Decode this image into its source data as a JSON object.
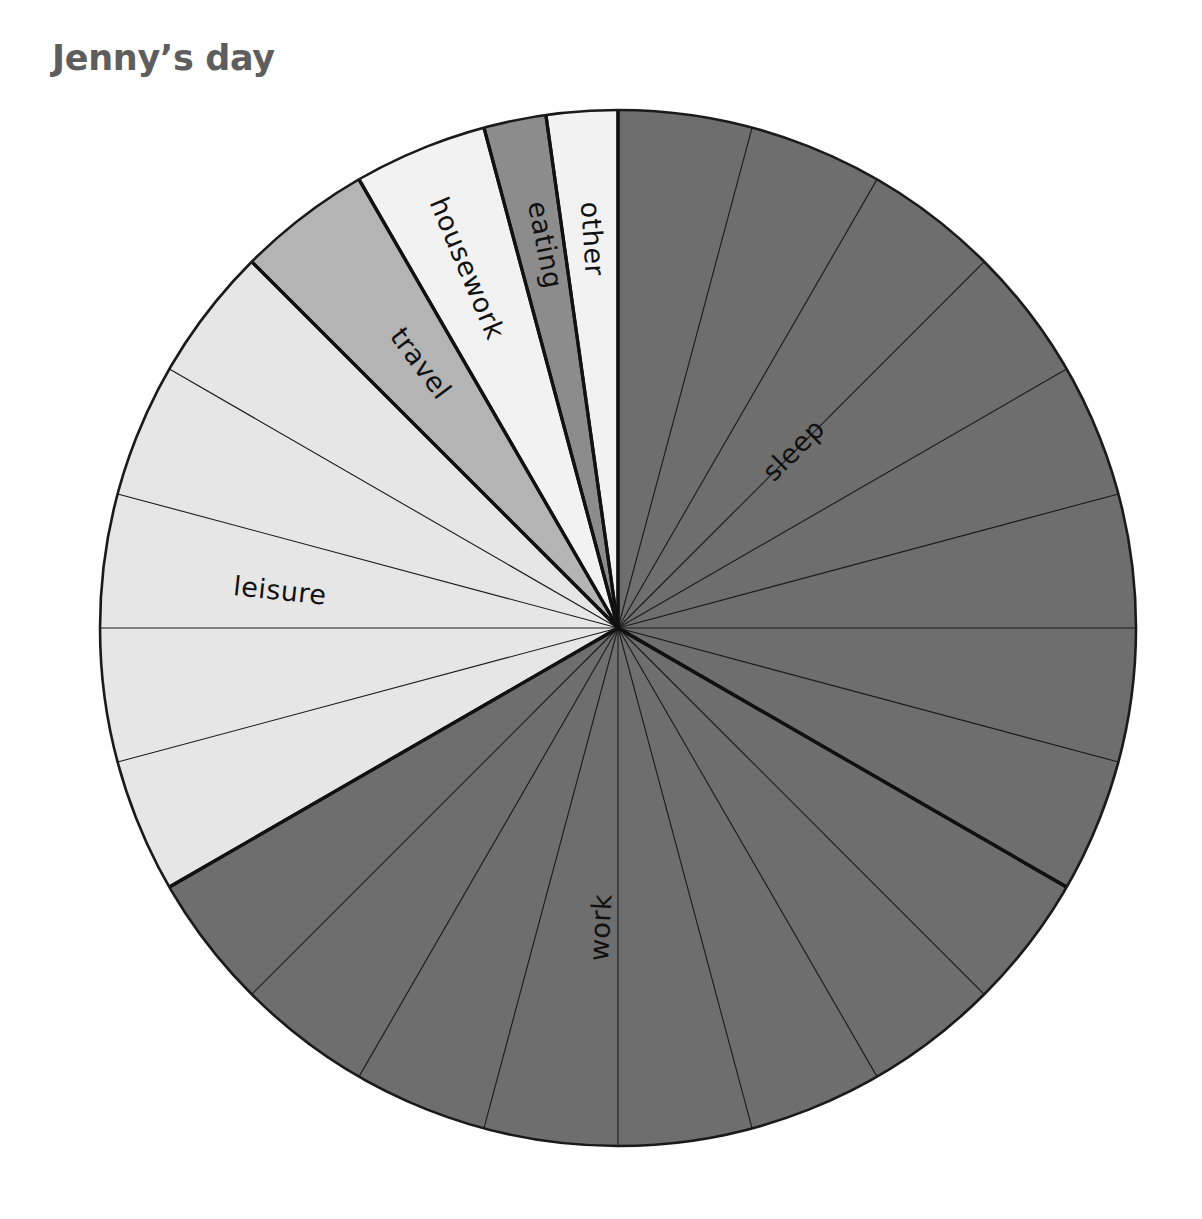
{
  "title": "Jenny’s day",
  "chart_data": {
    "type": "pie",
    "title": "Jenny’s day",
    "subtitle": "",
    "xlabel": "",
    "ylabel": "",
    "units": "hours",
    "total": 24,
    "start_angle_deg": 0,
    "direction": "clockwise",
    "grid": true,
    "gridline_interval_hours": 1,
    "legend": "none",
    "labels_inside_slices": true,
    "categories": [
      "sleep",
      "work",
      "leisure",
      "travel",
      "housework",
      "eating",
      "other"
    ],
    "values": [
      8,
      8,
      5,
      1,
      1,
      1,
      1
    ],
    "percentages": [
      33.3,
      33.3,
      20.8,
      4.2,
      4.2,
      4.2,
      4.2
    ],
    "colors": [
      "#6e6e6e",
      "#6e6e6e",
      "#e6e6e6",
      "#b4b4b4",
      "#f2f2f2",
      "#8c8c8c",
      "#f2f2f2"
    ],
    "slices": [
      {
        "label": "sleep",
        "value": 8,
        "start_deg": 0,
        "end_deg": 120,
        "color": "#6e6e6e",
        "label_angle_deg": 45,
        "label_radius": 250
      },
      {
        "label": "work",
        "value": 8,
        "start_deg": 120,
        "end_deg": 240,
        "color": "#6e6e6e",
        "label_angle_deg": 183,
        "label_radius": 300
      },
      {
        "label": "leisure",
        "value": 5,
        "start_deg": 240,
        "end_deg": 315,
        "color": "#e6e6e6",
        "label_angle_deg": 276,
        "label_radius": 340
      },
      {
        "label": "travel",
        "value": 1,
        "start_deg": 315,
        "end_deg": 330,
        "color": "#b4b4b4",
        "label_angle_deg": 323,
        "label_radius": 330
      },
      {
        "label": "housework",
        "value": 1,
        "start_deg": 330,
        "end_deg": 345,
        "color": "#f2f2f2",
        "label_angle_deg": 337,
        "label_radius": 390
      },
      {
        "label": "eating",
        "value": 1,
        "start_deg": 345,
        "end_deg": 352,
        "color": "#8c8c8c",
        "label_angle_deg": 349,
        "label_radius": 390
      },
      {
        "label": "other",
        "value": 1,
        "start_deg": 352,
        "end_deg": 360,
        "color": "#f2f2f2",
        "label_angle_deg": 356,
        "label_radius": 390
      }
    ]
  },
  "geometry": {
    "center_x": 618,
    "center_y": 628,
    "radius": 518
  }
}
